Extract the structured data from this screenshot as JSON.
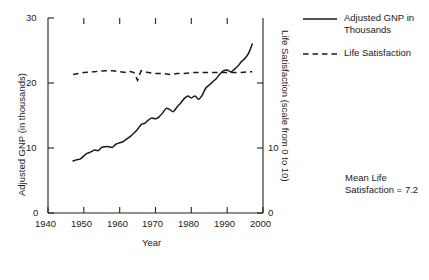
{
  "chart_data": {
    "type": "line",
    "title": "",
    "xlabel": "Year",
    "ylabel": "Adjusted GNP (in thousands)",
    "y2label": "Life Satisfaction (scale from 0 to 10)",
    "xlim": [
      1940,
      2000
    ],
    "ylim": [
      0,
      30
    ],
    "y2lim": [
      0,
      10
    ],
    "grid": false,
    "legend_position": "right",
    "xticks": [
      1940,
      1950,
      1960,
      1970,
      1980,
      1990,
      2000
    ],
    "xtick_labels": [
      "1940",
      "1950",
      "1960",
      "1970",
      "1980",
      "1990",
      "2000"
    ],
    "yticks": [
      0,
      10,
      20,
      30
    ],
    "ytick_labels": [
      "0",
      "10",
      "20",
      "30"
    ],
    "y2ticks": [
      0,
      10
    ],
    "y2tick_labels": [
      "0",
      "10"
    ],
    "annotation": "Mean Life Satisfaction = 7.2",
    "annotation_line1": "Mean Life",
    "annotation_line2": "Satisfaction = 7.2",
    "series": [
      {
        "name": "Adjusted GNP in Thousands",
        "legend_line1": "Adjusted GNP in",
        "legend_line2": "Thousands",
        "style": "solid",
        "axis": "left",
        "color": "#1a1a1a",
        "x": [
          1947,
          1948,
          1949,
          1950,
          1951,
          1952,
          1953,
          1954,
          1955,
          1956,
          1957,
          1958,
          1959,
          1960,
          1961,
          1962,
          1963,
          1964,
          1965,
          1966,
          1967,
          1968,
          1969,
          1970,
          1971,
          1972,
          1973,
          1974,
          1975,
          1976,
          1977,
          1978,
          1979,
          1980,
          1981,
          1982,
          1983,
          1984,
          1985,
          1986,
          1987,
          1988,
          1989,
          1990,
          1991,
          1992,
          1993,
          1994,
          1995,
          1996,
          1997
        ],
        "y": [
          8.0,
          8.2,
          8.3,
          8.8,
          9.2,
          9.4,
          9.7,
          9.6,
          10.1,
          10.2,
          10.2,
          10.1,
          10.6,
          10.8,
          11.0,
          11.4,
          11.8,
          12.3,
          12.9,
          13.6,
          13.8,
          14.3,
          14.6,
          14.5,
          14.8,
          15.4,
          16.1,
          15.9,
          15.6,
          16.3,
          16.9,
          17.6,
          18.0,
          17.7,
          18.0,
          17.5,
          18.1,
          19.2,
          19.7,
          20.2,
          20.7,
          21.4,
          21.9,
          22.0,
          21.7,
          22.1,
          22.6,
          23.3,
          23.8,
          24.6,
          26.0
        ]
      },
      {
        "name": "Life Satisfaction",
        "legend_line1": "Life Satisfaction",
        "legend_line2": "",
        "style": "dashed",
        "axis": "right",
        "color": "#1a1a1a",
        "x": [
          1947,
          1950,
          1953,
          1956,
          1958,
          1960,
          1962,
          1963,
          1964,
          1965,
          1966,
          1967,
          1968,
          1970,
          1972,
          1974,
          1976,
          1978,
          1980,
          1982,
          1984,
          1986,
          1988,
          1990,
          1992,
          1994,
          1996,
          1997
        ],
        "y": [
          7.1,
          7.2,
          7.25,
          7.3,
          7.3,
          7.25,
          7.2,
          7.25,
          7.2,
          6.8,
          7.3,
          7.25,
          7.2,
          7.15,
          7.15,
          7.1,
          7.15,
          7.15,
          7.2,
          7.2,
          7.2,
          7.2,
          7.2,
          7.2,
          7.2,
          7.2,
          7.25,
          7.25
        ]
      }
    ],
    "mean_life_satisfaction": 7.2
  },
  "legend": {
    "items": [
      {
        "label_line1": "Adjusted GNP in",
        "label_line2": "Thousands",
        "style": "solid"
      },
      {
        "label_line1": "Life Satisfaction",
        "label_line2": "",
        "style": "dashed"
      }
    ]
  }
}
